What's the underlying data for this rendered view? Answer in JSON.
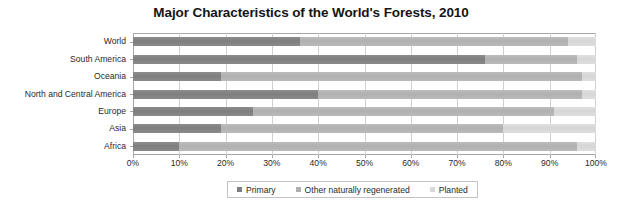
{
  "chart_data": {
    "type": "bar",
    "orientation": "horizontal",
    "stacked": true,
    "stack_mode": "percent",
    "title": "Major Characteristics of the World's Forests, 2010",
    "xlabel": "",
    "ylabel": "",
    "xlim": [
      0,
      100
    ],
    "xticks": [
      0,
      10,
      20,
      30,
      40,
      50,
      60,
      70,
      80,
      90,
      100
    ],
    "xtick_labels": [
      "0%",
      "10%",
      "20%",
      "30%",
      "40%",
      "50%",
      "60%",
      "70%",
      "80%",
      "90%",
      "100%"
    ],
    "grid": true,
    "grid_axis": "x",
    "legend_position": "bottom",
    "categories": [
      "World",
      "South America",
      "Oceania",
      "North and Central America",
      "Europe",
      "Asia",
      "Africa"
    ],
    "series": [
      {
        "name": "Primary",
        "color": "#808080",
        "values": [
          36,
          76,
          19,
          40,
          26,
          19,
          10
        ]
      },
      {
        "name": "Other naturally regenerated",
        "color": "#b0b0b0",
        "values": [
          58,
          20,
          78,
          57,
          65,
          61,
          86
        ]
      },
      {
        "name": "Planted",
        "color": "#d8d8d8",
        "values": [
          6,
          4,
          3,
          3,
          9,
          20,
          4
        ]
      }
    ]
  },
  "legend": {
    "items": [
      {
        "label": "Primary",
        "swatch": "sw-primary"
      },
      {
        "label": "Other naturally regenerated",
        "swatch": "sw-other"
      },
      {
        "label": "Planted",
        "swatch": "sw-planted"
      }
    ]
  },
  "colors": {
    "primary": "#808080",
    "other_naturally_regenerated": "#b0b0b0",
    "planted": "#d8d8d8",
    "axis": "#a6a6a6",
    "gridline": "#d0d0d0",
    "text": "#2a2a2a",
    "title": "#151515",
    "background": "#ffffff"
  }
}
